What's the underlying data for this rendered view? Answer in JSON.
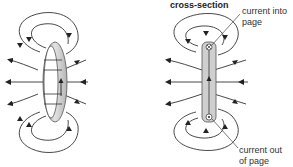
{
  "figure": {
    "panels": [
      {
        "id": "loop-3d",
        "description": "current loop with magnetic field lines",
        "object": "ring"
      },
      {
        "id": "cross-section",
        "title": "cross-section",
        "object": "loop cross-section",
        "labels": {
          "top": "current into page",
          "top_line1": "current into",
          "top_line2": "page",
          "bottom": "current out of page",
          "bottom_line1": "current out",
          "bottom_line2": "of page"
        },
        "symbols": {
          "top": "cross (into page)",
          "bottom": "dot (out of page)"
        }
      }
    ],
    "colors": {
      "line": "#333333",
      "ring_fill": "#c8c8c8",
      "ring_edge": "#555555"
    }
  }
}
